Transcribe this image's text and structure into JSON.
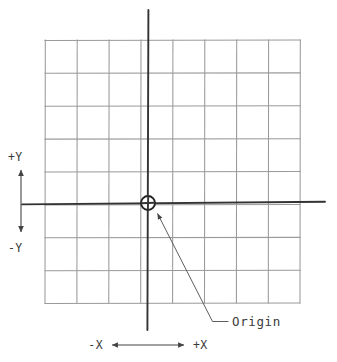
{
  "figure": {
    "kind": "cartesian-coordinate-grid-diagram",
    "background_color": "#ffffff",
    "grid_color": "#9a9a9a",
    "axis_color": "#333333",
    "leader_color": "#555555",
    "text_color": "#3a3a3a"
  },
  "grid": {
    "columns": 8,
    "rows": 8,
    "left": 45,
    "top": 40,
    "right": 300,
    "bottom": 303,
    "cell_width": 31.9,
    "cell_height": 32.9
  },
  "axes": {
    "x_axis": {
      "label_negative": "-X",
      "label_positive": "+X",
      "y": 203,
      "x_start": 22,
      "x_end": 325
    },
    "y_axis": {
      "label_positive": "+Y",
      "label_negative": "-Y",
      "x": 148,
      "y_start": 10,
      "y_end": 330
    }
  },
  "origin": {
    "label": "Origin",
    "x": 148,
    "y": 203,
    "marker_radius": 7,
    "label_x": 232,
    "label_y": 324
  },
  "direction_indicators": {
    "vertical": {
      "top_label": "+Y",
      "bottom_label": "-Y",
      "arrow_x": 21,
      "arrow_top": 168,
      "arrow_bottom": 234
    },
    "horizontal": {
      "left_label": "-X",
      "right_label": "+X",
      "arrow_y": 345,
      "arrow_left": 110,
      "arrow_right": 186
    }
  }
}
